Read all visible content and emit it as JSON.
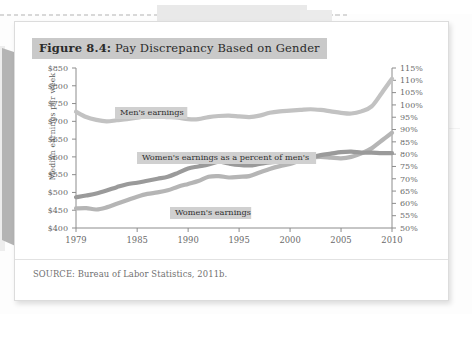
{
  "figure": {
    "label": "Figure 8.4:",
    "title_text": " Pay Discrepancy Based on Gender",
    "source": "SOURCE: Bureau of Labor Statistics, 2011b."
  },
  "colors": {
    "title_highlight": "#c9c9c9",
    "card_background": "#ffffff",
    "axis": "#8c8c8c",
    "mens_line": "#c2c2c2",
    "womens_line": "#b5b5b5",
    "percent_line": "#9a9a9a",
    "label_highlight": "#d0d0d0",
    "tick_text": "#6a6a6a"
  },
  "chart_data": {
    "type": "line",
    "title": "Pay Discrepancy Based on Gender",
    "xlabel": "",
    "ylabel": "Median earnings per week",
    "y2label": "",
    "xlim": [
      1979,
      2010
    ],
    "ylim": [
      400,
      850
    ],
    "y2lim": [
      50,
      115
    ],
    "grid": false,
    "legend": "inline-labels",
    "xticks": [
      1979,
      1985,
      1990,
      1995,
      2000,
      2005,
      2010
    ],
    "xtick_labels": [
      "1979",
      "1985",
      "1990",
      "1995",
      "2000",
      "2005",
      "2010"
    ],
    "yticks": [
      400,
      450,
      500,
      550,
      600,
      650,
      700,
      750,
      800,
      850
    ],
    "ytick_labels": [
      "$400",
      "$450",
      "$500",
      "$550",
      "$600",
      "$650",
      "$700",
      "$750",
      "$800",
      "$850"
    ],
    "y2ticks": [
      50,
      55,
      60,
      65,
      70,
      75,
      80,
      85,
      90,
      95,
      100,
      105,
      110,
      115
    ],
    "y2tick_labels": [
      "50%",
      "55%",
      "60%",
      "65%",
      "70%",
      "75%",
      "80%",
      "85%",
      "90%",
      "95%",
      "100%",
      "105%",
      "110%",
      "115%"
    ],
    "x": [
      1979,
      1980,
      1981,
      1982,
      1983,
      1984,
      1985,
      1986,
      1987,
      1988,
      1989,
      1990,
      1991,
      1992,
      1993,
      1994,
      1995,
      1996,
      1997,
      1998,
      1999,
      2000,
      2001,
      2002,
      2003,
      2004,
      2005,
      2006,
      2007,
      2008,
      2009,
      2010
    ],
    "series": [
      {
        "name": "Men's earnings",
        "axis": "left",
        "units": "dollars per week",
        "label_text": "Men's earnings",
        "values": [
          727,
          712,
          704,
          700,
          703,
          706,
          710,
          715,
          714,
          712,
          710,
          706,
          706,
          712,
          715,
          716,
          714,
          712,
          716,
          724,
          728,
          730,
          732,
          734,
          732,
          728,
          724,
          722,
          728,
          742,
          780,
          820
        ]
      },
      {
        "name": "Women's earnings",
        "axis": "left",
        "units": "dollars per week",
        "label_text": "Women's earnings",
        "values": [
          455,
          456,
          452,
          458,
          468,
          478,
          488,
          496,
          500,
          506,
          516,
          524,
          532,
          544,
          546,
          542,
          544,
          546,
          556,
          566,
          574,
          580,
          590,
          598,
          600,
          598,
          596,
          600,
          610,
          624,
          646,
          668
        ]
      },
      {
        "name": "Women's earnings as a percent of men's",
        "axis": "right",
        "units": "percent",
        "label_text": "Women's earnings as a percent of men's",
        "values": [
          62.5,
          63.2,
          64.0,
          65.2,
          66.6,
          67.8,
          68.4,
          69.2,
          70.0,
          70.8,
          72.4,
          74.2,
          75.0,
          75.8,
          77.0,
          76.2,
          75.6,
          75.4,
          76.0,
          76.6,
          77.0,
          77.4,
          78.0,
          78.6,
          79.6,
          80.2,
          80.8,
          81.0,
          80.6,
          80.6,
          80.4,
          80.4
        ]
      }
    ]
  }
}
